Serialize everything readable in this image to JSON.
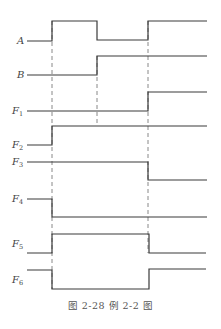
{
  "caption": "图 2-28   例 2-2 图",
  "diagram": {
    "time_marks_x": [
      52,
      97,
      148
    ],
    "x_start": 27,
    "x_end": 207,
    "signals": [
      {
        "name": "A",
        "sub": "",
        "label_y": 44,
        "points": "27,41 52,41 52,21 97,21 97,40 148,40 148,21 207,21"
      },
      {
        "name": "B",
        "sub": "",
        "label_y": 78,
        "points": "27,75 97,75 97,56 207,56"
      },
      {
        "name": "F",
        "sub": "1",
        "label_y": 114,
        "points": "27,111 148,111 148,92 207,92"
      },
      {
        "name": "F",
        "sub": "2",
        "label_y": 148,
        "points": "27,145 52,145 52,126 207,126"
      },
      {
        "name": "F",
        "sub": "3",
        "label_y": 165,
        "points": "27,162 148,162 148,180 207,180"
      },
      {
        "name": "F",
        "sub": "4",
        "label_y": 202,
        "points": "27,199 52,199 52,217 207,217"
      },
      {
        "name": "F",
        "sub": "5",
        "label_y": 247,
        "points": "27,253 52,253 52,234 149,234 149,253 206,253"
      },
      {
        "name": "F",
        "sub": "6",
        "label_y": 283,
        "points": "27,270 52,270 52,289 149,289 149,269 206,269"
      }
    ]
  }
}
